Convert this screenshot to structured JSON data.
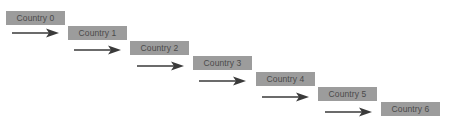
{
  "diagram": {
    "type": "staircase-flow",
    "nodes": [
      {
        "id": 0,
        "label": "Country 0",
        "x": 6,
        "y": 11
      },
      {
        "id": 1,
        "label": "Country 1",
        "x": 68,
        "y": 26
      },
      {
        "id": 2,
        "label": "Country 2",
        "x": 130,
        "y": 41
      },
      {
        "id": 3,
        "label": "Country 3",
        "x": 193,
        "y": 56
      },
      {
        "id": 4,
        "label": "Country 4",
        "x": 256,
        "y": 72
      },
      {
        "id": 5,
        "label": "Country 5",
        "x": 318,
        "y": 87
      },
      {
        "id": 6,
        "label": "Country 6",
        "x": 381,
        "y": 102
      }
    ],
    "edges": [
      {
        "from": 0,
        "to": 1,
        "x": 12,
        "y": 28
      },
      {
        "from": 1,
        "to": 2,
        "x": 74,
        "y": 45
      },
      {
        "from": 2,
        "to": 3,
        "x": 137,
        "y": 61
      },
      {
        "from": 3,
        "to": 4,
        "x": 199,
        "y": 76
      },
      {
        "from": 4,
        "to": 5,
        "x": 262,
        "y": 92
      },
      {
        "from": 5,
        "to": 6,
        "x": 325,
        "y": 107
      }
    ],
    "colors": {
      "box_fill": "#9c9c9c",
      "box_text": "#4a4a4a",
      "arrow": "#3a3a3a",
      "background": "#ffffff"
    }
  }
}
